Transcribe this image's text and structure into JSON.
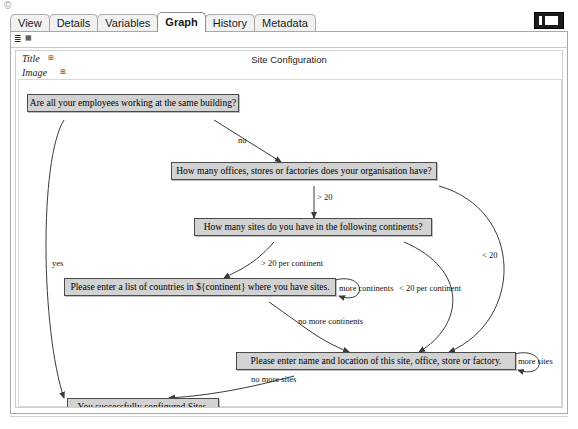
{
  "window": {
    "stray_glyph": "©",
    "badge_name": "window-restore-badge"
  },
  "tabs": [
    {
      "label": "View",
      "selected": false
    },
    {
      "label": "Details",
      "selected": false
    },
    {
      "label": "Variables",
      "selected": false
    },
    {
      "label": "Graph",
      "selected": true
    },
    {
      "label": "History",
      "selected": false
    },
    {
      "label": "Metadata",
      "selected": false
    }
  ],
  "toolbar": {
    "icon_a": "≣",
    "icon_b": "▦"
  },
  "form": {
    "title_label": "Title",
    "title_icon": "⊞",
    "image_label": "Image",
    "image_icon": "⊞"
  },
  "graph": {
    "title": "Site Configuration",
    "nodes": [
      {
        "id": "n1",
        "text": "Are all your employees working at the same building?"
      },
      {
        "id": "n2",
        "text": "How many offices, stores or factories does your organisation have?"
      },
      {
        "id": "n3",
        "text": "How many sites do you have in the following continents?"
      },
      {
        "id": "n4",
        "text": "Please enter a list of countries in ${continent} where you have sites."
      },
      {
        "id": "n5",
        "text": "Please enter name and location of this site, office, store or factory."
      },
      {
        "id": "n6",
        "text": "You successfully configured Sites."
      }
    ],
    "edge_labels": [
      {
        "id": "e_no",
        "text": "no"
      },
      {
        "id": "e_yes",
        "text": "yes"
      },
      {
        "id": "e_gt20",
        "text": "> 20"
      },
      {
        "id": "e_lt20",
        "text": "< 20"
      },
      {
        "id": "e_gt20percont",
        "text": "> 20 per continent"
      },
      {
        "id": "e_lt20percont",
        "text": "< 20 per continent"
      },
      {
        "id": "e_morecont",
        "text": "more continents"
      },
      {
        "id": "e_nomorecont",
        "text": "no more continents"
      },
      {
        "id": "e_moresites",
        "text": "more sites"
      },
      {
        "id": "e_nomoresites",
        "text": "no more sites"
      }
    ]
  },
  "colors": {
    "node_fill": "#d2d2d2",
    "node_border": "#4a4a4a",
    "edge": "#3a3a3a",
    "tab_active": "#ffffff",
    "tab_inactive": "#f1f1f1"
  }
}
